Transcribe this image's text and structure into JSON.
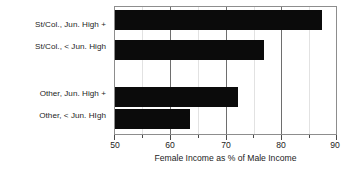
{
  "chart_data": {
    "type": "bar",
    "orientation": "horizontal",
    "title": "",
    "subtitle": "",
    "xlabel": "Female Income as % of Male Income",
    "ylabel": "",
    "xlim": [
      50,
      90
    ],
    "xticks": [
      50,
      60,
      70,
      80,
      90
    ],
    "xtick_labels": [
      "50",
      "60",
      "70",
      "80",
      "90"
    ],
    "minor_xticks": [
      55,
      65,
      75,
      85
    ],
    "grid": "vertical-major-and-minor",
    "legend": "none",
    "bar_color": "#0b0b0b",
    "categories": [
      "St/Col., Jun. High +",
      "St/Col., < Jun. High",
      "Other, Jun. High +",
      "Other, < Jun. HIgh"
    ],
    "values": [
      87.5,
      77.0,
      72.2,
      63.5
    ],
    "bars": [
      {
        "label": "St/Col., Jun. High +",
        "value": 87.5
      },
      {
        "label": "St/Col., < Jun. High",
        "value": 77.0
      },
      {
        "label": "Other, Jun. High +",
        "value": 72.2
      },
      {
        "label": "Other, < Jun. HIgh",
        "value": 63.5
      }
    ],
    "annotations": []
  }
}
